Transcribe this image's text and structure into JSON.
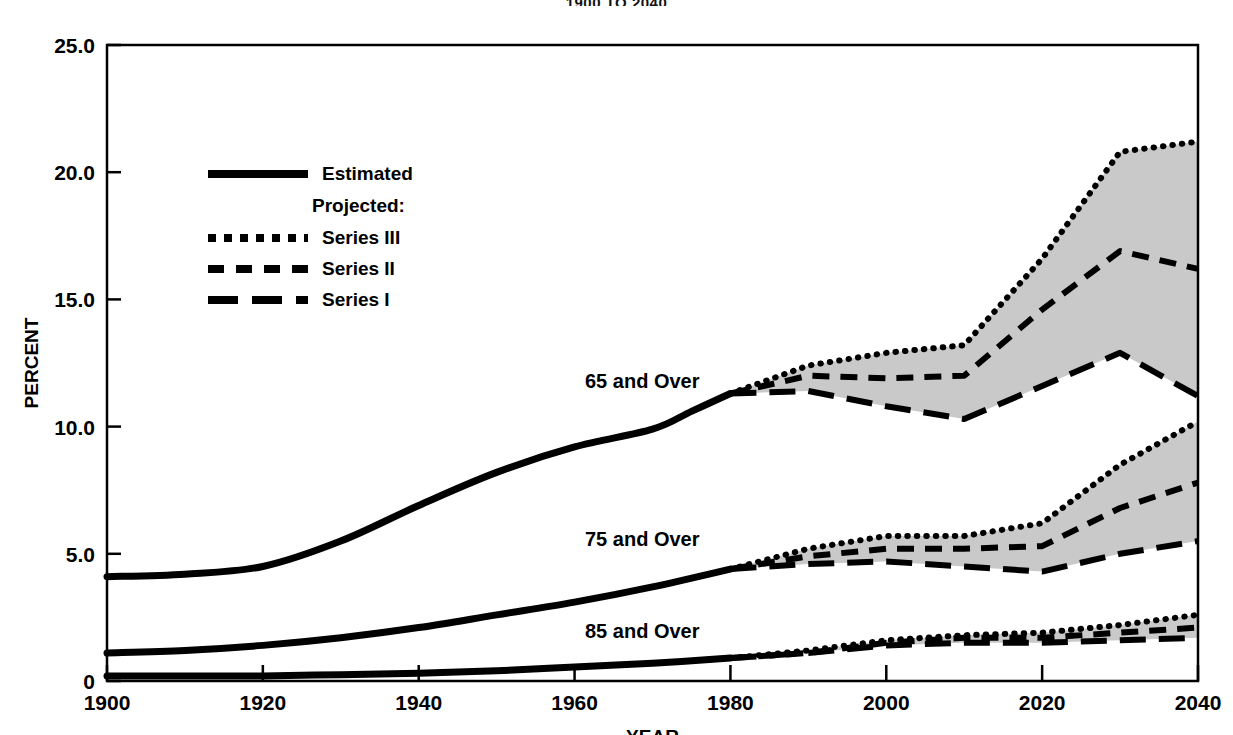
{
  "title": "1900 TO 2040",
  "axes": {
    "ylabel": "PERCENT",
    "xlabel": "YEAR",
    "yticks": [
      "25.0",
      "20.0",
      "15.0",
      "10.0",
      "5.0",
      "0"
    ],
    "xticks": [
      "1900",
      "1920",
      "1940",
      "1960",
      "1980",
      "2000",
      "2020",
      "2040"
    ]
  },
  "legend": {
    "estimated": "Estimated",
    "projected_header": "Projected:",
    "series3": "Series III",
    "series2": "Series II",
    "series1": "Series I"
  },
  "annotations": {
    "g65": "65 and Over",
    "g75": "75 and Over",
    "g85": "85 and Over"
  },
  "colors": {
    "line": "#000000",
    "band_fill": "#c9c9c9",
    "axis": "#000000",
    "background": "#ffffff"
  },
  "chart_data": {
    "type": "line",
    "title": "1900 TO 2040",
    "xlabel": "YEAR",
    "ylabel": "PERCENT",
    "xlim": [
      1900,
      2040
    ],
    "ylim": [
      0,
      25
    ],
    "yticks": [
      0,
      5,
      10,
      15,
      20,
      25
    ],
    "xticks": [
      1900,
      1920,
      1940,
      1960,
      1980,
      2000,
      2020,
      2040
    ],
    "grid": false,
    "legend_position": "upper-left-inside",
    "band_fill_between": "Series III (upper) and Series I (lower)",
    "groups": [
      {
        "name": "65 and Over",
        "estimated": {
          "x": [
            1900,
            1910,
            1920,
            1930,
            1940,
            1950,
            1960,
            1970,
            1975,
            1980
          ],
          "y": [
            4.1,
            4.2,
            4.5,
            5.5,
            6.9,
            8.2,
            9.2,
            9.9,
            10.6,
            11.3
          ]
        },
        "series": [
          {
            "name": "Series III",
            "style": "dotted",
            "x": [
              1980,
              1990,
              2000,
              2010,
              2020,
              2030,
              2040
            ],
            "y": [
              11.3,
              12.4,
              12.9,
              13.2,
              16.6,
              20.8,
              21.2
            ]
          },
          {
            "name": "Series II",
            "style": "dashed",
            "x": [
              1980,
              1990,
              2000,
              2010,
              2020,
              2030,
              2040
            ],
            "y": [
              11.3,
              12.0,
              11.9,
              12.0,
              14.6,
              16.9,
              16.2
            ]
          },
          {
            "name": "Series I",
            "style": "long-dash",
            "x": [
              1980,
              1990,
              2000,
              2010,
              2020,
              2030,
              2040
            ],
            "y": [
              11.3,
              11.4,
              10.8,
              10.3,
              11.6,
              12.9,
              11.2
            ]
          }
        ]
      },
      {
        "name": "75 and Over",
        "estimated": {
          "x": [
            1900,
            1910,
            1920,
            1930,
            1940,
            1950,
            1960,
            1970,
            1980
          ],
          "y": [
            1.1,
            1.2,
            1.4,
            1.7,
            2.1,
            2.6,
            3.1,
            3.7,
            4.4
          ]
        },
        "series": [
          {
            "name": "Series III",
            "style": "dotted",
            "x": [
              1980,
              1990,
              2000,
              2010,
              2020,
              2030,
              2040
            ],
            "y": [
              4.4,
              5.2,
              5.7,
              5.7,
              6.2,
              8.5,
              10.2
            ]
          },
          {
            "name": "Series II",
            "style": "dashed",
            "x": [
              1980,
              1990,
              2000,
              2010,
              2020,
              2030,
              2040
            ],
            "y": [
              4.4,
              4.9,
              5.2,
              5.2,
              5.3,
              6.8,
              7.8
            ]
          },
          {
            "name": "Series I",
            "style": "long-dash",
            "x": [
              1980,
              1990,
              2000,
              2010,
              2020,
              2030,
              2040
            ],
            "y": [
              4.4,
              4.6,
              4.7,
              4.5,
              4.3,
              5.0,
              5.5
            ]
          }
        ]
      },
      {
        "name": "85 and Over",
        "estimated": {
          "x": [
            1900,
            1910,
            1920,
            1930,
            1940,
            1950,
            1960,
            1970,
            1980
          ],
          "y": [
            0.2,
            0.2,
            0.2,
            0.25,
            0.3,
            0.4,
            0.55,
            0.7,
            0.9
          ]
        },
        "series": [
          {
            "name": "Series III",
            "style": "dotted",
            "x": [
              1980,
              1990,
              2000,
              2010,
              2020,
              2030,
              2040
            ],
            "y": [
              0.9,
              1.2,
              1.6,
              1.8,
              1.9,
              2.2,
              2.6
            ]
          },
          {
            "name": "Series II",
            "style": "dashed",
            "x": [
              1980,
              1990,
              2000,
              2010,
              2020,
              2030,
              2040
            ],
            "y": [
              0.9,
              1.1,
              1.5,
              1.7,
              1.7,
              1.9,
              2.1
            ]
          },
          {
            "name": "Series I",
            "style": "long-dash",
            "x": [
              1980,
              1990,
              2000,
              2010,
              2020,
              2030,
              2040
            ],
            "y": [
              0.9,
              1.1,
              1.4,
              1.5,
              1.5,
              1.6,
              1.7
            ]
          }
        ]
      }
    ]
  }
}
